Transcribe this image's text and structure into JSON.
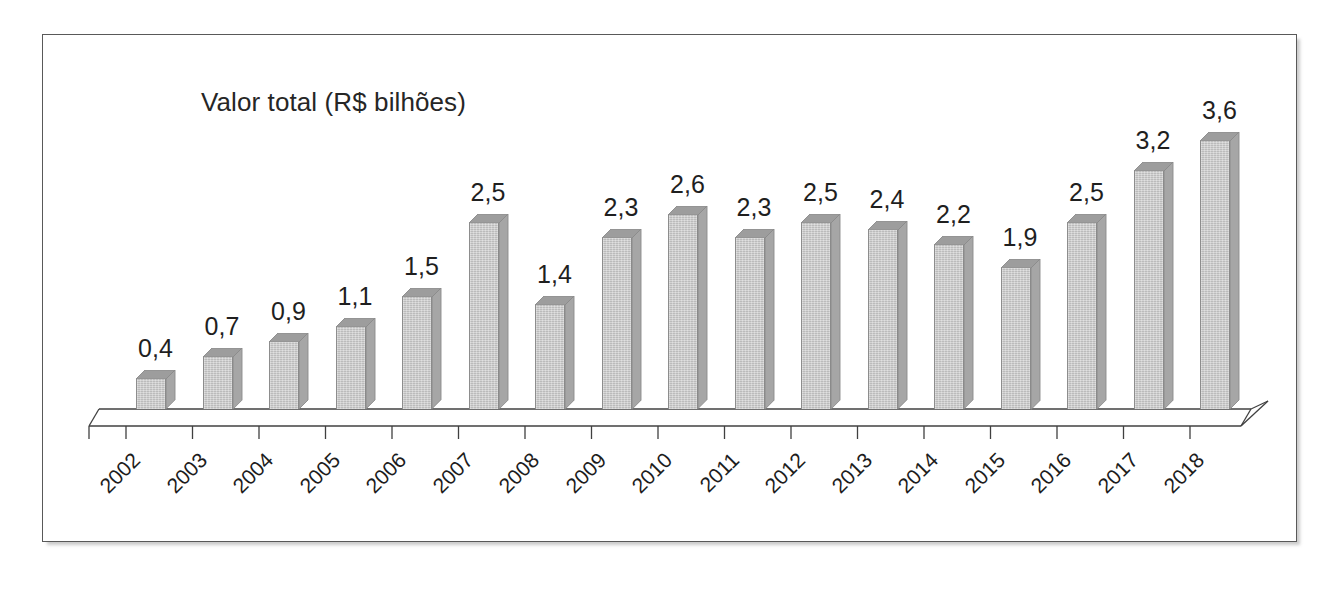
{
  "chart_data": {
    "type": "bar",
    "title": "Valor total (R$ bilhões)",
    "xlabel": "",
    "ylabel": "",
    "ylim": [
      0,
      3.6
    ],
    "grid": false,
    "legend": false,
    "three_d": true,
    "decimal_separator": ",",
    "categories": [
      "2002",
      "2003",
      "2004",
      "2005",
      "2006",
      "2007",
      "2008",
      "2009",
      "2010",
      "2011",
      "2012",
      "2013",
      "2014",
      "2015",
      "2016",
      "2017",
      "2018"
    ],
    "values": [
      0.4,
      0.7,
      0.9,
      1.1,
      1.5,
      2.5,
      1.4,
      2.3,
      2.6,
      2.3,
      2.5,
      2.4,
      2.2,
      1.9,
      2.5,
      3.2,
      3.6
    ],
    "value_labels": [
      "0,4",
      "0,7",
      "0,9",
      "1,1",
      "1,5",
      "2,5",
      "1,4",
      "2,3",
      "2,6",
      "2,3",
      "2,5",
      "2,4",
      "2,2",
      "1,9",
      "2,5",
      "3,2",
      "3,6"
    ],
    "series": [
      {
        "name": "Valor total (R$ bilhões)",
        "values": [
          0.4,
          0.7,
          0.9,
          1.1,
          1.5,
          2.5,
          1.4,
          2.3,
          2.6,
          2.3,
          2.5,
          2.4,
          2.2,
          1.9,
          2.5,
          3.2,
          3.6
        ]
      }
    ]
  },
  "colors": {
    "bar_front": "#c6c6c6",
    "bar_side": "#a6a6a6",
    "bar_top": "#9d9d9d",
    "bar_outline": "#8a8a8a",
    "axis_line": "#404040",
    "frame_border": "#595959",
    "title_text": "#262626",
    "label_text": "#1f1f1f",
    "background": "#ffffff"
  },
  "frame": {
    "has_border": true,
    "has_drop_shadow": true
  }
}
